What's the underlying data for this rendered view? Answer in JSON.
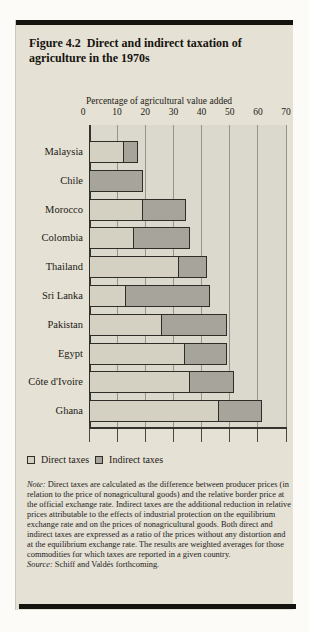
{
  "figure": {
    "label": "Figure 4.2",
    "title": "Direct and indirect taxation of agriculture in the 1970s",
    "note_label": "Note:",
    "note_text": " Direct taxes are calculated as the difference between producer prices (in relation to the price of nonagricultural goods) and the relative border price at the official exchange rate. Indirect taxes are the additional reduction in relative prices attributable to the effects of industrial protection on the equilibrium exchange rate and on the prices of nonagricultural goods. Both direct and indirect taxes are expressed as a ratio of the prices without any distortion and at the equilibrium exchange rate. The results are weighted averages for those commodities for which taxes are reported in a given country.",
    "source_label": "Source:",
    "source_text": " Schiff and Valdés forthcoming."
  },
  "colors": {
    "direct": "#d4d1c3",
    "indirect": "#a6a49b",
    "bar_border": "#2f2d27",
    "panel_bg": "#e5e1d5",
    "plot_bg": "#dbd8cd",
    "grid": "#95938b",
    "rule": "#15130e"
  },
  "chart_data": {
    "type": "bar",
    "orientation": "horizontal",
    "stacked": true,
    "xlabel": "Percentage of agricultural value added",
    "ylabel": "",
    "xlim": [
      0,
      70
    ],
    "ticks": [
      0,
      10,
      20,
      30,
      40,
      50,
      60,
      70
    ],
    "grid": true,
    "legend_position": "bottom",
    "categories": [
      "Malaysia",
      "Chile",
      "Morocco",
      "Colombia",
      "Thailand",
      "Sri Lanka",
      "Pakistan",
      "Egypt",
      "Côte d'Ivoire",
      "Ghana"
    ],
    "series": [
      {
        "name": "Direct taxes",
        "values": [
          12.5,
          0,
          19,
          16,
          32,
          13,
          26,
          34,
          36,
          46
        ]
      },
      {
        "name": "Indirect taxes",
        "values": [
          5,
          19,
          15.5,
          20,
          10,
          30,
          23,
          15,
          15.5,
          15.5
        ]
      }
    ]
  }
}
